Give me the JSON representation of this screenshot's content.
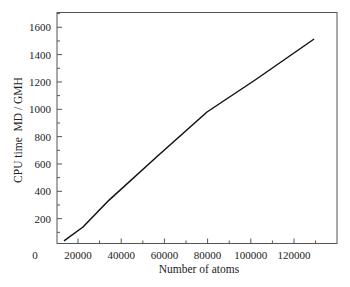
{
  "chart_data": {
    "type": "line",
    "title": "",
    "xlabel": "Number of atoms",
    "ylabel": "CPU time  MD / GMH",
    "xlim": [
      0,
      136000
    ],
    "ylim": [
      0,
      1700
    ],
    "grid": false,
    "legend": null,
    "x_ticks": [
      20000,
      40000,
      60000,
      80000,
      100000,
      120000
    ],
    "x_tick_labels": [
      "20000",
      "40000",
      "60000",
      "80000",
      "100000",
      "120000"
    ],
    "x_origin_label": "0",
    "x_minor_tick_step": 10000,
    "y_ticks": [
      200,
      400,
      600,
      800,
      1000,
      1200,
      1400,
      1600
    ],
    "y_tick_labels": [
      "200",
      "400",
      "600",
      "800",
      "1000",
      "1200",
      "1400",
      "1600"
    ],
    "y_minor_tick_step": 100,
    "series": [
      {
        "name": "CPU time",
        "color": "#111111",
        "x": [
          13500,
          22300,
          34400,
          57000,
          79700,
          102000,
          129300
        ],
        "y": [
          37,
          139,
          336,
          660,
          980,
          1214,
          1514
        ]
      }
    ]
  },
  "colors": {
    "background": "#ffffff",
    "axis": "#555555",
    "line": "#111111",
    "text": "#222222"
  }
}
